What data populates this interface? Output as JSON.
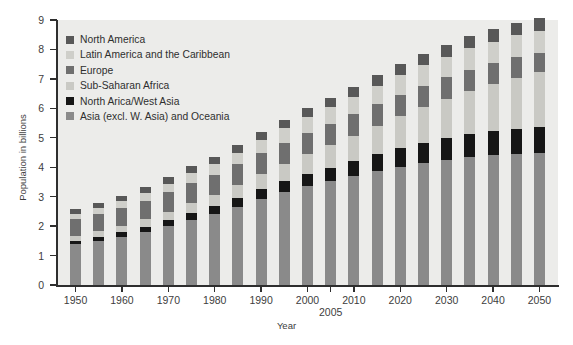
{
  "chart_data": {
    "type": "bar",
    "stacked": true,
    "title": "",
    "xlabel": "Year",
    "ylabel": "Population in billions",
    "ylim": [
      0,
      9
    ],
    "y_ticks": [
      0,
      1,
      2,
      3,
      4,
      5,
      6,
      7,
      8,
      9
    ],
    "grid": false,
    "legend_position": "top-left",
    "categories": [
      "1950",
      "1955",
      "1960",
      "1965",
      "1970",
      "1975",
      "1980",
      "1985",
      "1990",
      "1995",
      "2000",
      "2005",
      "2010",
      "2015",
      "2020",
      "2025",
      "2030",
      "2035",
      "2040",
      "2045",
      "2050"
    ],
    "x_tick_labels": [
      {
        "label": "1950",
        "category": "1950",
        "row": 1
      },
      {
        "label": "1960",
        "category": "1960",
        "row": 1
      },
      {
        "label": "1970",
        "category": "1970",
        "row": 1
      },
      {
        "label": "1980",
        "category": "1980",
        "row": 1
      },
      {
        "label": "1990",
        "category": "1990",
        "row": 1
      },
      {
        "label": "2000",
        "category": "2000",
        "row": 1
      },
      {
        "label": "2005",
        "category": "2005",
        "row": 2
      },
      {
        "label": "2010",
        "category": "2010",
        "row": 1
      },
      {
        "label": "2020",
        "category": "2020",
        "row": 1
      },
      {
        "label": "2030",
        "category": "2030",
        "row": 1
      },
      {
        "label": "2040",
        "category": "2040",
        "row": 1
      },
      {
        "label": "2050",
        "category": "2050",
        "row": 1
      }
    ],
    "series": [
      {
        "name": "Asia (excl. W. Asia) and Oceania",
        "color": "#8a8a8a",
        "stack_order": 0,
        "values": [
          1.38,
          1.5,
          1.64,
          1.8,
          2.0,
          2.22,
          2.42,
          2.66,
          2.92,
          3.15,
          3.35,
          3.52,
          3.7,
          3.87,
          4.02,
          4.15,
          4.26,
          4.35,
          4.41,
          4.45,
          4.47
        ]
      },
      {
        "name": "North Arica/West Asia",
        "color": "#161616",
        "stack_order": 1,
        "values": [
          0.12,
          0.13,
          0.15,
          0.17,
          0.2,
          0.23,
          0.26,
          0.3,
          0.34,
          0.38,
          0.43,
          0.47,
          0.52,
          0.57,
          0.63,
          0.68,
          0.73,
          0.78,
          0.82,
          0.86,
          0.89
        ]
      },
      {
        "name": "Sub-Saharan Africa",
        "color": "#c9c9c4",
        "stack_order": 2,
        "values": [
          0.18,
          0.2,
          0.23,
          0.26,
          0.29,
          0.33,
          0.38,
          0.44,
          0.51,
          0.58,
          0.66,
          0.75,
          0.85,
          0.96,
          1.08,
          1.21,
          1.34,
          1.47,
          1.6,
          1.73,
          1.86
        ]
      },
      {
        "name": "Europe",
        "color": "#6f6f6f",
        "stack_order": 3,
        "values": [
          0.55,
          0.58,
          0.6,
          0.63,
          0.66,
          0.68,
          0.69,
          0.7,
          0.72,
          0.73,
          0.73,
          0.73,
          0.74,
          0.74,
          0.73,
          0.73,
          0.72,
          0.71,
          0.7,
          0.69,
          0.67
        ]
      },
      {
        "name": "Latin America and the Caribbean",
        "color": "#cfcfca",
        "stack_order": 4,
        "values": [
          0.17,
          0.19,
          0.22,
          0.25,
          0.29,
          0.33,
          0.36,
          0.4,
          0.44,
          0.48,
          0.52,
          0.56,
          0.59,
          0.63,
          0.66,
          0.69,
          0.71,
          0.73,
          0.74,
          0.75,
          0.75
        ]
      },
      {
        "name": "North America",
        "color": "#585858",
        "stack_order": 5,
        "values": [
          0.17,
          0.19,
          0.2,
          0.22,
          0.23,
          0.24,
          0.25,
          0.27,
          0.28,
          0.3,
          0.31,
          0.33,
          0.34,
          0.36,
          0.37,
          0.39,
          0.4,
          0.41,
          0.42,
          0.43,
          0.44
        ]
      }
    ],
    "totals": [
      2.57,
      2.79,
      3.04,
      3.33,
      3.67,
      4.03,
      4.36,
      4.77,
      5.21,
      5.62,
      6.0,
      6.36,
      6.74,
      7.13,
      7.49,
      7.85,
      8.16,
      8.45,
      8.69,
      8.91,
      9.08
    ],
    "legend_order": [
      "North America",
      "Latin America and the Caribbean",
      "Europe",
      "Sub-Saharan Africa",
      "North Arica/West Asia",
      "Asia (excl. W. Asia) and Oceania"
    ]
  },
  "colors": {
    "plot_background": "#ececea",
    "page_background": "#ffffff",
    "axis": "#2e2e2e",
    "text": "#3d3d3d"
  }
}
